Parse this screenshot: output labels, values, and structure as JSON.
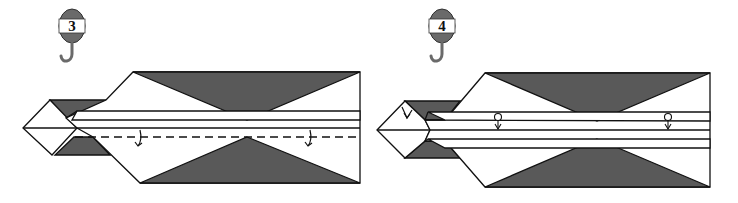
{
  "colors": {
    "paper_white": "#ffffff",
    "paper_dark": "#595959",
    "line": "#111111",
    "badge": "#6a6a6a"
  },
  "steps": [
    {
      "number": "3",
      "badge_icon": "crane-hook-weight-icon",
      "instruction": "valley-fold along dashed line",
      "arrows": [
        "fold-arrow",
        "fold-arrow"
      ]
    },
    {
      "number": "4",
      "badge_icon": "crane-hook-weight-icon",
      "instruction": "pleat / fold edges, tuck tip",
      "arrows": [
        "tuck-arrow",
        "pleat-arrow",
        "pleat-arrow"
      ]
    }
  ]
}
